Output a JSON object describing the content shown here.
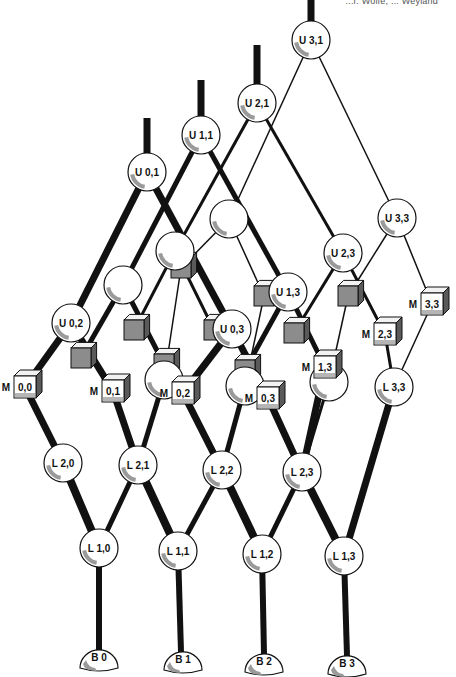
{
  "header": {
    "text": "...r. Wolfe, ... Weyland"
  },
  "diagram": {
    "type": "lattice-network",
    "colors": {
      "line": "#111111",
      "node_fill": "#ffffff",
      "node_shade": "#9a9a9a",
      "cube_face": "#8c8c8c",
      "cube_side": "#5a5a5a",
      "cube_top": "#f2f2f2"
    },
    "circles": [
      {
        "id": "U31",
        "label": "U  3,1",
        "x": 311,
        "y": 40,
        "r": 19
      },
      {
        "id": "U21",
        "label": "U  2,1",
        "x": 257,
        "y": 103,
        "r": 19
      },
      {
        "id": "U11",
        "label": "U  1,1",
        "x": 201,
        "y": 135,
        "r": 19
      },
      {
        "id": "U01",
        "label": "U  0,1",
        "x": 147,
        "y": 172,
        "r": 19
      },
      {
        "id": "U33",
        "label": "U  3,3",
        "x": 397,
        "y": 218,
        "r": 19
      },
      {
        "id": "U23",
        "label": "U  2,3",
        "x": 343,
        "y": 253,
        "r": 19
      },
      {
        "id": "U13",
        "label": "U  1,3",
        "x": 288,
        "y": 292,
        "r": 19
      },
      {
        "id": "U03",
        "label": "U  0,3",
        "x": 232,
        "y": 329,
        "r": 19
      },
      {
        "id": "U02",
        "label": "U  0,2",
        "x": 71,
        "y": 323,
        "r": 19
      },
      {
        "id": "C1",
        "label": "",
        "x": 229,
        "y": 219,
        "r": 19
      },
      {
        "id": "C2",
        "label": "",
        "x": 175,
        "y": 251,
        "r": 19
      },
      {
        "id": "C3",
        "label": "",
        "x": 123,
        "y": 285,
        "r": 19
      },
      {
        "id": "C4",
        "label": "",
        "x": 164,
        "y": 380,
        "r": 19
      },
      {
        "id": "C5",
        "label": "",
        "x": 245,
        "y": 386,
        "r": 19
      },
      {
        "id": "C6",
        "label": "",
        "x": 329,
        "y": 382,
        "r": 19
      },
      {
        "id": "L33",
        "label": "L  3,3",
        "x": 394,
        "y": 387,
        "r": 19
      },
      {
        "id": "L20",
        "label": "L  2,0",
        "x": 63,
        "y": 463,
        "r": 19
      },
      {
        "id": "L21",
        "label": "L  2,1",
        "x": 138,
        "y": 465,
        "r": 19
      },
      {
        "id": "L22",
        "label": "L  2,2",
        "x": 222,
        "y": 470,
        "r": 19
      },
      {
        "id": "L23",
        "label": "L  2,3",
        "x": 302,
        "y": 472,
        "r": 19
      },
      {
        "id": "L10",
        "label": "L  1,0",
        "x": 99,
        "y": 548,
        "r": 19
      },
      {
        "id": "L11",
        "label": "L  1,1",
        "x": 178,
        "y": 551,
        "r": 19
      },
      {
        "id": "L12",
        "label": "L  1,2",
        "x": 262,
        "y": 554,
        "r": 19
      },
      {
        "id": "L13",
        "label": "L  1,3",
        "x": 344,
        "y": 556,
        "r": 19
      }
    ],
    "bases": [
      {
        "id": "B0",
        "label": "B  0",
        "x": 99,
        "y": 662
      },
      {
        "id": "B1",
        "label": "B  1",
        "x": 183,
        "y": 664
      },
      {
        "id": "B2",
        "label": "B  2",
        "x": 264,
        "y": 666
      },
      {
        "id": "B3",
        "label": "B  3",
        "x": 347,
        "y": 668
      }
    ],
    "modules": [
      {
        "id": "M00",
        "prefix": "M",
        "label": "0,0",
        "x": 25,
        "y": 387
      },
      {
        "id": "M01",
        "prefix": "M",
        "label": "0,1",
        "x": 113,
        "y": 391
      },
      {
        "id": "M02",
        "prefix": "M",
        "label": "0,2",
        "x": 183,
        "y": 393
      },
      {
        "id": "M03",
        "prefix": "M",
        "label": "0,3",
        "x": 268,
        "y": 398
      },
      {
        "id": "M13",
        "prefix": "M",
        "label": "1,3",
        "x": 325,
        "y": 367
      },
      {
        "id": "M23",
        "prefix": "M",
        "label": "2,3",
        "x": 385,
        "y": 334
      },
      {
        "id": "M33",
        "prefix": "M",
        "label": "3,3",
        "x": 432,
        "y": 304
      }
    ],
    "cubes": [
      {
        "x": 181,
        "y": 268
      },
      {
        "x": 264,
        "y": 296
      },
      {
        "x": 348,
        "y": 296
      },
      {
        "x": 134,
        "y": 330
      },
      {
        "x": 214,
        "y": 330
      },
      {
        "x": 294,
        "y": 333
      },
      {
        "x": 81,
        "y": 358
      },
      {
        "x": 164,
        "y": 364
      },
      {
        "x": 245,
        "y": 370
      }
    ],
    "edges": [
      {
        "x1": 311,
        "y1": 0,
        "x2": 311,
        "y2": 28,
        "w": 7
      },
      {
        "x1": 257,
        "y1": 45,
        "x2": 257,
        "y2": 90,
        "w": 7
      },
      {
        "x1": 201,
        "y1": 80,
        "x2": 201,
        "y2": 122,
        "w": 7
      },
      {
        "x1": 147,
        "y1": 118,
        "x2": 147,
        "y2": 159,
        "w": 7
      },
      {
        "x1": 311,
        "y1": 40,
        "x2": 397,
        "y2": 218,
        "w": 1.5
      },
      {
        "x1": 311,
        "y1": 40,
        "x2": 229,
        "y2": 219,
        "w": 1.5
      },
      {
        "x1": 229,
        "y1": 219,
        "x2": 181,
        "y2": 268,
        "w": 1.5
      },
      {
        "x1": 229,
        "y1": 219,
        "x2": 264,
        "y2": 296,
        "w": 1.5
      },
      {
        "x1": 397,
        "y1": 218,
        "x2": 348,
        "y2": 296,
        "w": 1.5
      },
      {
        "x1": 397,
        "y1": 218,
        "x2": 432,
        "y2": 304,
        "w": 1.5
      },
      {
        "x1": 432,
        "y1": 304,
        "x2": 394,
        "y2": 387,
        "w": 1.5
      },
      {
        "x1": 348,
        "y1": 296,
        "x2": 329,
        "y2": 382,
        "w": 1.5
      },
      {
        "x1": 264,
        "y1": 296,
        "x2": 245,
        "y2": 386,
        "w": 1.5
      },
      {
        "x1": 181,
        "y1": 268,
        "x2": 164,
        "y2": 380,
        "w": 1.5
      },
      {
        "x1": 257,
        "y1": 103,
        "x2": 175,
        "y2": 251,
        "w": 3
      },
      {
        "x1": 257,
        "y1": 103,
        "x2": 343,
        "y2": 253,
        "w": 3
      },
      {
        "x1": 175,
        "y1": 251,
        "x2": 134,
        "y2": 330,
        "w": 3
      },
      {
        "x1": 175,
        "y1": 251,
        "x2": 214,
        "y2": 330,
        "w": 3
      },
      {
        "x1": 343,
        "y1": 253,
        "x2": 294,
        "y2": 333,
        "w": 3
      },
      {
        "x1": 343,
        "y1": 253,
        "x2": 385,
        "y2": 334,
        "w": 3
      },
      {
        "x1": 385,
        "y1": 334,
        "x2": 394,
        "y2": 387,
        "w": 3
      },
      {
        "x1": 201,
        "y1": 135,
        "x2": 123,
        "y2": 285,
        "w": 5
      },
      {
        "x1": 201,
        "y1": 135,
        "x2": 288,
        "y2": 292,
        "w": 5
      },
      {
        "x1": 123,
        "y1": 285,
        "x2": 81,
        "y2": 358,
        "w": 5
      },
      {
        "x1": 123,
        "y1": 285,
        "x2": 164,
        "y2": 364,
        "w": 5
      },
      {
        "x1": 288,
        "y1": 292,
        "x2": 245,
        "y2": 370,
        "w": 5
      },
      {
        "x1": 288,
        "y1": 292,
        "x2": 325,
        "y2": 367,
        "w": 5
      },
      {
        "x1": 147,
        "y1": 172,
        "x2": 71,
        "y2": 323,
        "w": 7
      },
      {
        "x1": 147,
        "y1": 172,
        "x2": 232,
        "y2": 329,
        "w": 7
      },
      {
        "x1": 71,
        "y1": 323,
        "x2": 25,
        "y2": 387,
        "w": 7
      },
      {
        "x1": 71,
        "y1": 323,
        "x2": 113,
        "y2": 391,
        "w": 7
      },
      {
        "x1": 232,
        "y1": 329,
        "x2": 183,
        "y2": 393,
        "w": 7
      },
      {
        "x1": 232,
        "y1": 329,
        "x2": 268,
        "y2": 398,
        "w": 7
      },
      {
        "x1": 25,
        "y1": 387,
        "x2": 63,
        "y2": 463,
        "w": 7
      },
      {
        "x1": 113,
        "y1": 391,
        "x2": 138,
        "y2": 465,
        "w": 7
      },
      {
        "x1": 164,
        "y1": 380,
        "x2": 138,
        "y2": 465,
        "w": 5
      },
      {
        "x1": 183,
        "y1": 393,
        "x2": 222,
        "y2": 470,
        "w": 7
      },
      {
        "x1": 245,
        "y1": 386,
        "x2": 222,
        "y2": 470,
        "w": 5
      },
      {
        "x1": 268,
        "y1": 398,
        "x2": 302,
        "y2": 472,
        "w": 7
      },
      {
        "x1": 325,
        "y1": 367,
        "x2": 302,
        "y2": 472,
        "w": 7
      },
      {
        "x1": 329,
        "y1": 382,
        "x2": 302,
        "y2": 472,
        "w": 3
      },
      {
        "x1": 394,
        "y1": 387,
        "x2": 344,
        "y2": 556,
        "w": 7
      },
      {
        "x1": 63,
        "y1": 463,
        "x2": 99,
        "y2": 548,
        "w": 8
      },
      {
        "x1": 138,
        "y1": 465,
        "x2": 99,
        "y2": 548,
        "w": 5
      },
      {
        "x1": 138,
        "y1": 465,
        "x2": 178,
        "y2": 551,
        "w": 8
      },
      {
        "x1": 222,
        "y1": 470,
        "x2": 178,
        "y2": 551,
        "w": 5
      },
      {
        "x1": 222,
        "y1": 470,
        "x2": 262,
        "y2": 554,
        "w": 8
      },
      {
        "x1": 302,
        "y1": 472,
        "x2": 262,
        "y2": 554,
        "w": 5
      },
      {
        "x1": 302,
        "y1": 472,
        "x2": 344,
        "y2": 556,
        "w": 8
      },
      {
        "x1": 99,
        "y1": 548,
        "x2": 99,
        "y2": 650,
        "w": 6
      },
      {
        "x1": 178,
        "y1": 551,
        "x2": 181,
        "y2": 652,
        "w": 6
      },
      {
        "x1": 262,
        "y1": 554,
        "x2": 264,
        "y2": 654,
        "w": 6
      },
      {
        "x1": 344,
        "y1": 556,
        "x2": 347,
        "y2": 656,
        "w": 6
      }
    ]
  }
}
